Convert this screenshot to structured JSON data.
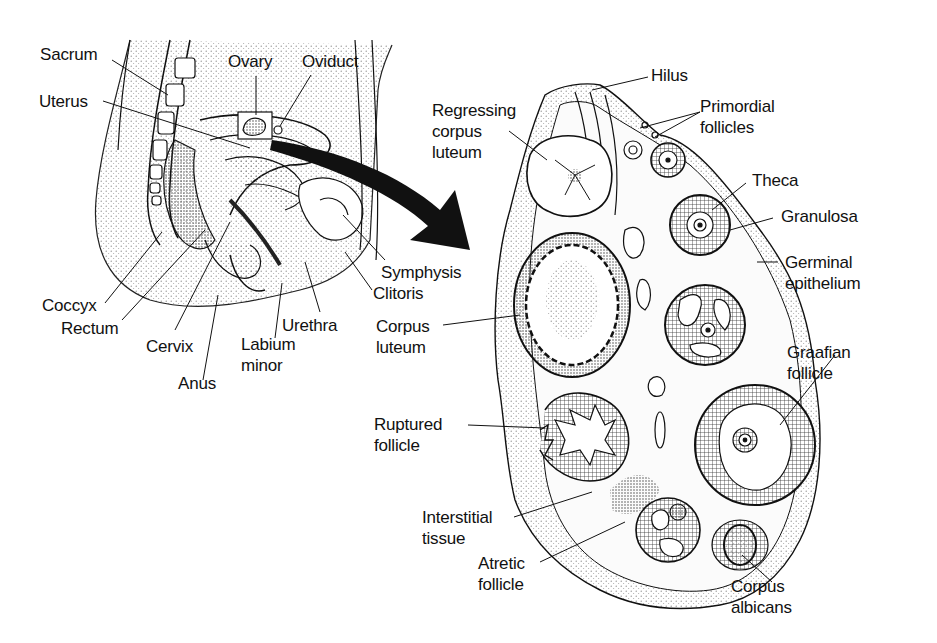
{
  "figure": {
    "left_panel": {
      "name": "Female pelvis sagittal section",
      "labels": {
        "sacrum": "Sacrum",
        "ovary": "Ovary",
        "oviduct": "Oviduct",
        "uterus": "Uterus",
        "coccyx": "Coccyx",
        "rectum": "Rectum",
        "cervix": "Cervix",
        "anus": "Anus",
        "urethra": "Urethra",
        "labium_minor_1": "Labium",
        "labium_minor_2": "minor",
        "symphysis": "Symphysis",
        "clitoris": "Clitoris"
      }
    },
    "right_panel": {
      "name": "Ovary cross section",
      "labels": {
        "hilus": "Hilus",
        "regressing_1": "Regressing",
        "regressing_2": "corpus",
        "regressing_3": "luteum",
        "primordial_1": "Primordial",
        "primordial_2": "follicles",
        "theca": "Theca",
        "granulosa": "Granulosa",
        "germinal_1": "Germinal",
        "germinal_2": "epithelium",
        "corpus_luteum_1": "Corpus",
        "corpus_luteum_2": "luteum",
        "graafian_1": "Graafian",
        "graafian_2": "follicle",
        "ruptured_1": "Ruptured",
        "ruptured_2": "follicle",
        "interstitial_1": "Interstitial",
        "interstitial_2": "tissue",
        "atretic_1": "Atretic",
        "atretic_2": "follicle",
        "albicans_1": "Corpus",
        "albicans_2": "albicans"
      }
    },
    "colors": {
      "ink": "#111111",
      "background": "#ffffff",
      "stipple": "#6a6a6a"
    }
  }
}
